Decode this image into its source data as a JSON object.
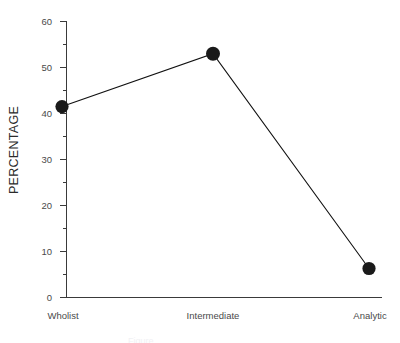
{
  "chart_data": {
    "type": "line",
    "title": "",
    "subtitle": "",
    "xlabel": "",
    "ylabel": "PERCENTAGE",
    "categories": [
      "Wholist",
      "Intermediate",
      "Analytic"
    ],
    "values": [
      41.5,
      53.0,
      6.3
    ],
    "series": [
      {
        "name": "Percentage",
        "values": [
          41.5,
          53.0,
          6.3
        ]
      }
    ],
    "ylim": [
      0,
      60
    ],
    "ytick_labels": [
      "0",
      "10",
      "20",
      "30",
      "40",
      "50",
      "60"
    ],
    "ytick_values": [
      0,
      10,
      20,
      30,
      40,
      50,
      60
    ],
    "yminor_values": [
      5,
      15,
      25,
      35,
      45,
      55
    ],
    "grid": false,
    "legend": false,
    "legend_position": "none",
    "marker": "filled-circle",
    "marker_color": "#1a1a1a",
    "line_color": "#111111",
    "axis_color": "#3a3a3a",
    "background": "#ffffff"
  },
  "axes": {
    "y_title": "PERCENTAGE",
    "x_categories": [
      {
        "label": "Wholist"
      },
      {
        "label": "Intermediate"
      },
      {
        "label": "Analytic"
      }
    ],
    "y_ticks": [
      {
        "label": "60"
      },
      {
        "label": "50"
      },
      {
        "label": "40"
      },
      {
        "label": "30"
      },
      {
        "label": "20"
      },
      {
        "label": "10"
      },
      {
        "label": "0"
      }
    ]
  },
  "caption": {
    "clipped_text": "Figure"
  }
}
